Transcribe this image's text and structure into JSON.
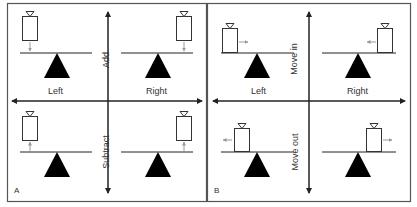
{
  "figure": {
    "panels": [
      {
        "id": "A",
        "panel_label": "A",
        "horizontal_axis": {
          "left_label": "Left",
          "right_label": "Right"
        },
        "vertical_axis": {
          "top_label": "Add",
          "bottom_label": "Subtract"
        },
        "quadrants": [
          {
            "position": "top-left",
            "weight_side": "left",
            "arrow": "down",
            "description": "Weight added on left"
          },
          {
            "position": "top-right",
            "weight_side": "right",
            "arrow": "down",
            "description": "Weight added on right"
          },
          {
            "position": "bottom-left",
            "weight_side": "left",
            "arrow": "up",
            "description": "Weight subtracted on left"
          },
          {
            "position": "bottom-right",
            "weight_side": "right",
            "arrow": "up",
            "description": "Weight subtracted on right"
          }
        ]
      },
      {
        "id": "B",
        "panel_label": "B",
        "horizontal_axis": {
          "left_label": "Left",
          "right_label": "Right"
        },
        "vertical_axis": {
          "top_label": "Move in",
          "bottom_label": "Move out"
        },
        "quadrants": [
          {
            "position": "top-left",
            "weight_side": "left",
            "arrow": "right",
            "description": "Weight moved in on left"
          },
          {
            "position": "top-right",
            "weight_side": "right",
            "arrow": "left",
            "description": "Weight moved in on right"
          },
          {
            "position": "bottom-left",
            "weight_side": "left",
            "arrow": "left",
            "description": "Weight moved out on left"
          },
          {
            "position": "bottom-right",
            "weight_side": "right",
            "arrow": "right",
            "description": "Weight moved out on right"
          }
        ]
      }
    ],
    "colors": {
      "line": "#222222",
      "fulcrum": "#000000",
      "arrow_gray": "#9a9a9a",
      "border": "#555555"
    }
  }
}
